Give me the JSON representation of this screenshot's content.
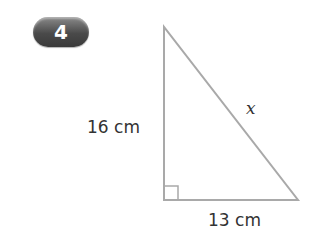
{
  "problem": {
    "number": "4"
  },
  "triangle": {
    "vertical_side": "16 cm",
    "horizontal_side": "13 cm",
    "hypotenuse": "x",
    "right_angle_marker": true,
    "line_color": "#a9a9a9"
  }
}
